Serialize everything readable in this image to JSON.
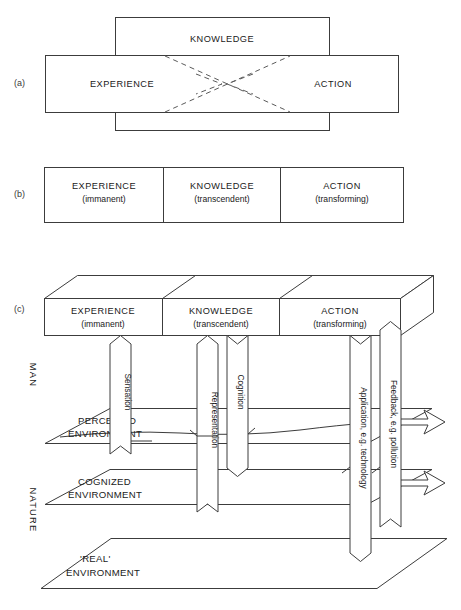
{
  "figure": {
    "panels": [
      {
        "id": "a",
        "label": "(a)"
      },
      {
        "id": "b",
        "label": "(b)"
      },
      {
        "id": "c",
        "label": "(c)"
      }
    ]
  },
  "panel_a": {
    "label": "(a)",
    "boxes": [
      {
        "name": "experience",
        "title": "EXPERIENCE"
      },
      {
        "name": "knowledge",
        "title": "KNOWLEDGE"
      },
      {
        "name": "action",
        "title": "ACTION"
      }
    ]
  },
  "panel_b": {
    "label": "(b)",
    "cells": [
      {
        "name": "experience",
        "title": "EXPERIENCE",
        "subtitle": "(immanent)"
      },
      {
        "name": "knowledge",
        "title": "KNOWLEDGE",
        "subtitle": "(transcendent)"
      },
      {
        "name": "action",
        "title": "ACTION",
        "subtitle": "(transforming)"
      }
    ]
  },
  "panel_c": {
    "label": "(c)",
    "cells": [
      {
        "name": "experience",
        "title": "EXPERIENCE",
        "subtitle": "(immanent)"
      },
      {
        "name": "knowledge",
        "title": "KNOWLEDGE",
        "subtitle": "(transcendent)"
      },
      {
        "name": "action",
        "title": "ACTION",
        "subtitle": "(transforming)"
      }
    ],
    "side_labels": [
      {
        "name": "man",
        "text": "MAN"
      },
      {
        "name": "nature",
        "text": "NATURE"
      }
    ],
    "flows": [
      {
        "name": "sensation",
        "text": "Sensation",
        "direction": "up"
      },
      {
        "name": "representation",
        "text": "Representation",
        "direction": "up"
      },
      {
        "name": "cognition",
        "text": "Cognition",
        "direction": "down"
      },
      {
        "name": "application",
        "text": "Application, e.g. technology",
        "direction": "down"
      },
      {
        "name": "feedback",
        "text": "Feedback, e.g. pollution",
        "direction": "up"
      }
    ],
    "planes": [
      {
        "name": "perceived-environment",
        "line1": "PERCEIVED",
        "line2": "ENVIRONMENT"
      },
      {
        "name": "cognized-environment",
        "line1": "COGNIZED",
        "line2": "ENVIRONMENT"
      },
      {
        "name": "real-environment",
        "line1": "'REAL'",
        "line2": "ENVIRONMENT"
      }
    ]
  },
  "colors": {
    "stroke": "#3c3c3c",
    "dashed_stroke": "#5a5a5a",
    "text": "#1a1a1a",
    "background": "#ffffff"
  }
}
